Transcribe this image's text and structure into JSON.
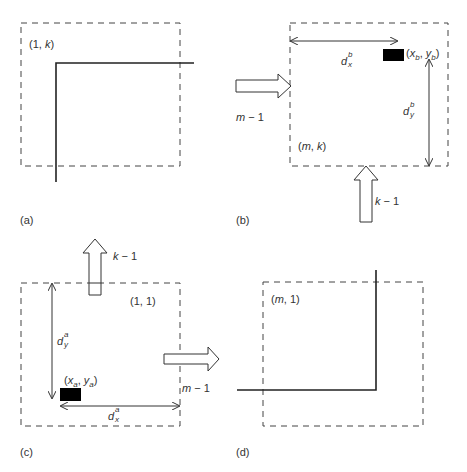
{
  "figure": {
    "panels": [
      {
        "id": "a",
        "caption": "(a)",
        "cell_label": "(1, k)"
      },
      {
        "id": "b",
        "caption": "(b)",
        "cell_label": "(m, k)",
        "point_label": "(x_b, y_b)",
        "dx_label": "d_x^b",
        "dy_label": "d_y^b",
        "arrow_right_label": "m − 1",
        "arrow_up_label": "k − 1"
      },
      {
        "id": "c",
        "caption": "(c)",
        "cell_label": "(1, 1)",
        "point_label": "(x_a, y_a)",
        "dx_label": "d_x^a",
        "dy_label": "d_y^a",
        "arrow_right_label": "m − 1",
        "arrow_up_label": "k − 1"
      },
      {
        "id": "d",
        "caption": "(d)",
        "cell_label": "(m, 1)"
      }
    ],
    "text": {
      "a_caption": "(a)",
      "b_caption": "(b)",
      "c_caption": "(c)",
      "d_caption": "(d)",
      "a_open": "(1, ",
      "a_k": "k",
      "a_close": ")",
      "b_m": "m",
      "b_comma": ", ",
      "b_k": "k",
      "d_m": "m",
      "d_rest": ", 1)",
      "c_cell": "(1, 1)",
      "d_letter": "d",
      "x_sub_b": "b",
      "y_sub_b": "b",
      "x_sub_a": "a",
      "y_sub_a": "a",
      "sup_x": "x",
      "sup_y": "y",
      "m": "m",
      "minus1": " − 1",
      "k": "k",
      "x": "x",
      "y": "y"
    },
    "colors": {
      "line": "#222222",
      "dashed": "#444444",
      "block": "#000000"
    }
  }
}
